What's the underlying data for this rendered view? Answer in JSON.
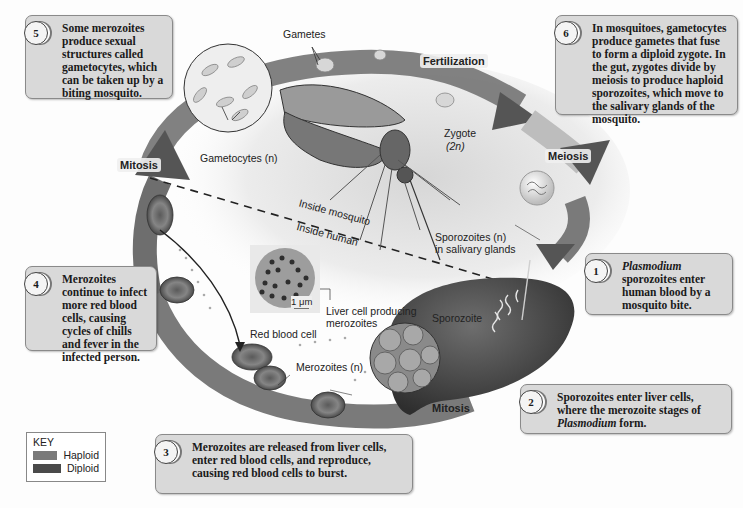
{
  "colors": {
    "haploid": "#7a7a7a",
    "diploid": "#4a4a4a",
    "callout_bg": "#d9d9d9",
    "callout_border": "#8a8a8a"
  },
  "callouts": [
    {
      "num": "1",
      "parts": [
        "",
        "Plasmodium",
        " sporozoites enter human blood by a mosquito bite."
      ]
    },
    {
      "num": "2",
      "parts": [
        "Sporozoites enter liver cells, where the merozoite stages of ",
        "Plasmodium",
        " form."
      ]
    },
    {
      "num": "3",
      "parts": [
        "Merozoites are released from liver cells, enter red blood cells, and reproduce, causing red blood cells to burst.",
        "",
        ""
      ]
    },
    {
      "num": "4",
      "parts": [
        "Merozoites continue to infect more red blood cells, causing cycles of chills and fever in the infected person.",
        "",
        ""
      ]
    },
    {
      "num": "5",
      "parts": [
        "Some merozoites produce sexual structures called gametocytes, which can be taken up by a biting mosquito.",
        "",
        ""
      ]
    },
    {
      "num": "6",
      "parts": [
        "In mosquitoes, gametocytes produce gametes that fuse to form a diploid zygote. In the gut, zygotes divide by meiosis to produce haploid sporozoites, which move to the salivary glands of the mosquito.",
        "",
        ""
      ]
    }
  ],
  "labels": {
    "gametes": "Gametes",
    "fertilization": "Fertilization",
    "zygote": "Zygote",
    "zygote_ploidy": "(2n)",
    "meiosis": "Meiosis",
    "gametocytes": "Gametocytes (n)",
    "mitosis_top": "Mitosis",
    "mitosis_bottom": "Mitosis",
    "inside_mosquito": "Inside mosquito",
    "inside_human": "Inside human",
    "sporozoites_salivary_1": "Sporozoites (n)",
    "sporozoites_salivary_2": "in salivary glands",
    "sporozoite": "Sporozoite",
    "scale": "1 μm",
    "liver_cell_1": "Liver cell producing",
    "liver_cell_2": "merozoites",
    "red_blood_cell": "Red blood cell",
    "merozoites": "Merozoites (n)"
  },
  "key": {
    "title": "KEY",
    "items": [
      {
        "label": "Haploid",
        "color": "#7a7a7a"
      },
      {
        "label": "Diploid",
        "color": "#4a4a4a"
      }
    ]
  }
}
